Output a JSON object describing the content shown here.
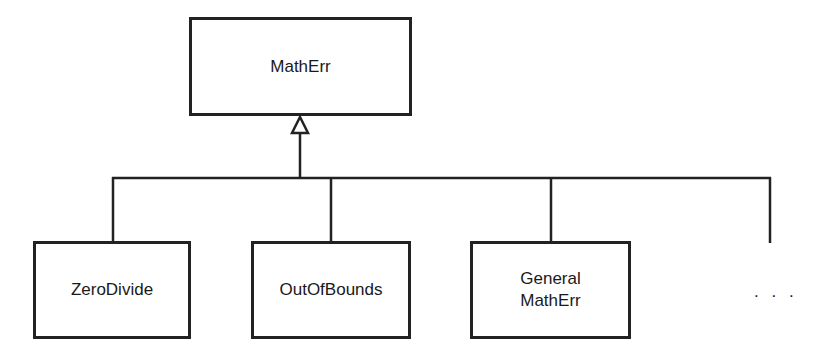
{
  "diagram": {
    "type": "class-hierarchy",
    "parent": {
      "label": "MathErr"
    },
    "children": [
      {
        "label": "ZeroDivide"
      },
      {
        "label": "OutOfBounds"
      },
      {
        "label": "General\nMathErr"
      }
    ],
    "more_indicator": ". . .",
    "relationship": "generalization (inheritance)"
  }
}
